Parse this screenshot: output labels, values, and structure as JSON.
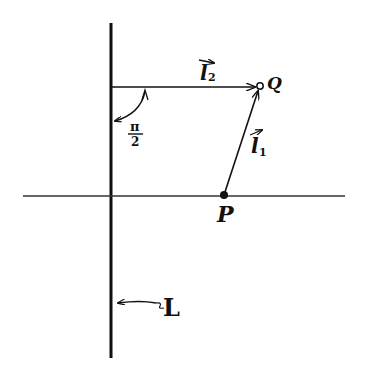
{
  "diagram": {
    "type": "geometry-vector-diagram",
    "labels": {
      "line_L": "L",
      "point_P": "P",
      "point_Q": "Q",
      "vector_l1": "l",
      "vector_l1_sub": "1",
      "vector_l2": "l",
      "vector_l2_sub": "2",
      "angle_num": "π",
      "angle_den": "2"
    },
    "points": {
      "P": {
        "x": 224,
        "y": 195
      },
      "Q": {
        "x": 260,
        "y": 86
      }
    },
    "lines": {
      "L_vertical": {
        "x": 111,
        "y1": 23,
        "y2": 358
      },
      "horizontal_axis": {
        "y": 196,
        "x1": 23,
        "x2": 345
      }
    },
    "vectors": [
      {
        "name": "l1",
        "from": "P",
        "to": "Q"
      },
      {
        "name": "l2",
        "from_x": 111,
        "from_y": 87,
        "to": "Q"
      }
    ],
    "angle": {
      "value": "π/2",
      "between": [
        "L",
        "l2"
      ]
    },
    "stroke_color": "#111111",
    "background": "#ffffff"
  }
}
